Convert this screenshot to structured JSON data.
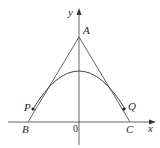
{
  "diagram": {
    "type": "geometry",
    "axes": {
      "x_label": "x",
      "y_label": "y",
      "origin_label": "0"
    },
    "points": {
      "A": "A",
      "B": "B",
      "C": "C",
      "P": "P",
      "Q": "Q"
    },
    "colors": {
      "stroke": "#555555",
      "text": "#2a2a2a",
      "background": "#ffffff"
    }
  }
}
